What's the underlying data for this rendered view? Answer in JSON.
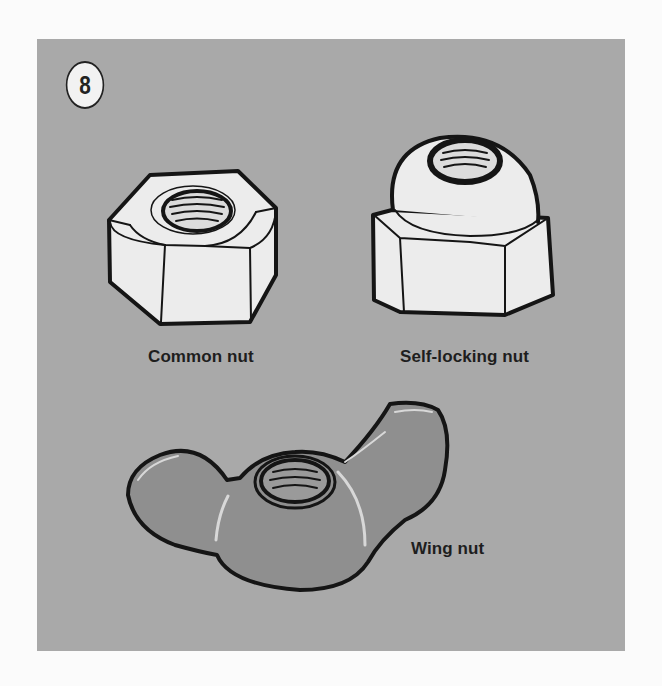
{
  "figure": {
    "number": "8",
    "background_color": "#a9a9a9",
    "items": [
      {
        "name": "common-nut",
        "label": "Common nut"
      },
      {
        "name": "self-locking-nut",
        "label": "Self-locking nut"
      },
      {
        "name": "wing-nut",
        "label": "Wing nut"
      }
    ]
  }
}
